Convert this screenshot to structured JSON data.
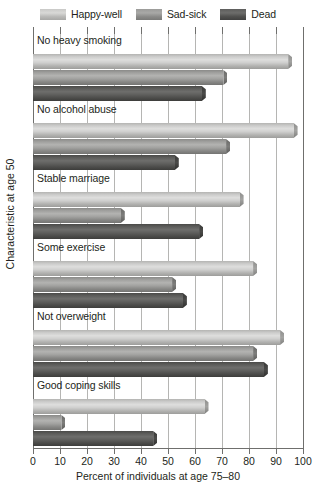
{
  "legend": {
    "items": [
      {
        "label": "Happy-well",
        "swatch_class": "sw-happy",
        "color": "#cfcfce"
      },
      {
        "label": "Sad-sick",
        "swatch_class": "sw-sad",
        "color": "#a2a2a0"
      },
      {
        "label": "Dead",
        "swatch_class": "sw-dead",
        "color": "#5f5f5d"
      }
    ]
  },
  "axes": {
    "xlabel": "Percent of individuals at age 75–80",
    "ylabel": "Characteristic at age 50",
    "xticks": [
      "0",
      "10",
      "20",
      "30",
      "40",
      "50",
      "60",
      "70",
      "80",
      "90",
      "100"
    ]
  },
  "chart_data": {
    "type": "bar",
    "orientation": "horizontal",
    "title": "",
    "xlabel": "Percent of individuals at age 75–80",
    "ylabel": "Characteristic at age 50",
    "xlim": [
      0,
      100
    ],
    "xticks": [
      0,
      10,
      20,
      30,
      40,
      50,
      60,
      70,
      80,
      90,
      100
    ],
    "grid": true,
    "legend_position": "top",
    "categories": [
      "No heavy smoking",
      "No alcohol abuse",
      "Stable marriage",
      "Some exercise",
      "Not overweight",
      "Good coping skills"
    ],
    "series": [
      {
        "name": "Happy-well",
        "values": [
          96,
          98,
          78,
          83,
          93,
          65
        ]
      },
      {
        "name": "Sad-sick",
        "values": [
          72,
          73,
          34,
          53,
          83,
          12
        ]
      },
      {
        "name": "Dead",
        "values": [
          64,
          54,
          63,
          57,
          87,
          46
        ]
      }
    ]
  }
}
